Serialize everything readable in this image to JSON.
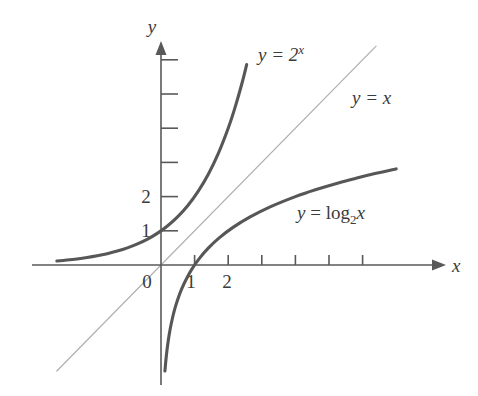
{
  "figure": {
    "background_color": "#ffffff",
    "axis_color": "#595959",
    "curve_color": "#575757",
    "identity_line_color": "#b0b0b0",
    "text_color": "#3b3b3b"
  },
  "chart_data": {
    "type": "line",
    "title": "",
    "xlabel": "x",
    "ylabel": "y",
    "xlim": [
      -3.1,
      7.4
    ],
    "ylim": [
      -3.6,
      6.2
    ],
    "grid": false,
    "legend": "inline-curve-labels",
    "x_tick_labels": [
      "0",
      "1",
      "2"
    ],
    "x_tick_values": [
      0,
      1,
      2
    ],
    "x_unlabeled_tick_values": [
      3,
      4,
      5,
      6
    ],
    "y_tick_labels": [
      "1",
      "2"
    ],
    "y_tick_values": [
      1,
      2
    ],
    "y_unlabeled_tick_values": [
      3,
      4,
      5,
      6
    ],
    "origin_label": "0",
    "series": [
      {
        "name": "y = 2^x",
        "label_text": "y = 2",
        "label_exponent": "x",
        "label_kind": "exponential",
        "style": "bold",
        "x": [
          -3.1,
          -2.8,
          -2.5,
          -2.2,
          -1.9,
          -1.6,
          -1.3,
          -1.0,
          -0.7,
          -0.4,
          -0.1,
          0.2,
          0.5,
          0.8,
          1.1,
          1.4,
          1.7,
          2.0,
          2.2,
          2.4,
          2.55
        ],
        "y": [
          0.116,
          0.144,
          0.177,
          0.218,
          0.268,
          0.33,
          0.406,
          0.5,
          0.616,
          0.758,
          0.933,
          1.149,
          1.414,
          1.741,
          2.144,
          2.639,
          3.249,
          4.0,
          4.595,
          5.278,
          5.86
        ]
      },
      {
        "name": "y = x",
        "label_text": "y = x",
        "label_kind": "identity",
        "style": "thin",
        "x": [
          -3.1,
          6.4
        ],
        "y": [
          -3.1,
          6.4
        ]
      },
      {
        "name": "y = log2 x",
        "label_text": "y = log",
        "label_sub": "2",
        "label_var": "x",
        "label_kind": "logarithm",
        "style": "bold",
        "x": [
          0.116,
          0.144,
          0.177,
          0.218,
          0.268,
          0.33,
          0.406,
          0.5,
          0.616,
          0.758,
          0.933,
          1.149,
          1.414,
          1.741,
          2.144,
          2.639,
          3.249,
          4.0,
          4.595,
          5.278,
          5.86,
          6.4,
          7.0
        ],
        "y": [
          -3.1,
          -2.8,
          -2.5,
          -2.2,
          -1.9,
          -1.6,
          -1.3,
          -1.0,
          -0.7,
          -0.4,
          -0.1,
          0.2,
          0.5,
          0.8,
          1.1,
          1.4,
          1.7,
          2.0,
          2.2,
          2.4,
          2.55,
          2.68,
          2.81
        ]
      }
    ],
    "annotations": [
      {
        "text": "y = 2^x",
        "x": 2.6,
        "y": 5.6
      },
      {
        "text": "y = x",
        "x": 5.6,
        "y": 4.3
      },
      {
        "text": "y = log_2 x",
        "x": 4.2,
        "y": 1.35
      }
    ]
  },
  "labels": {
    "y_axis": "y",
    "x_axis": "x",
    "origin": "0",
    "x_tick_1": "1",
    "x_tick_2": "2",
    "y_tick_1": "1",
    "y_tick_2": "2",
    "exp_label_base": "y = 2",
    "exp_label_exponent": "x",
    "identity_label": "y = x",
    "log_label_head": "y = log",
    "log_label_sub": "2",
    "log_label_var": "x"
  }
}
